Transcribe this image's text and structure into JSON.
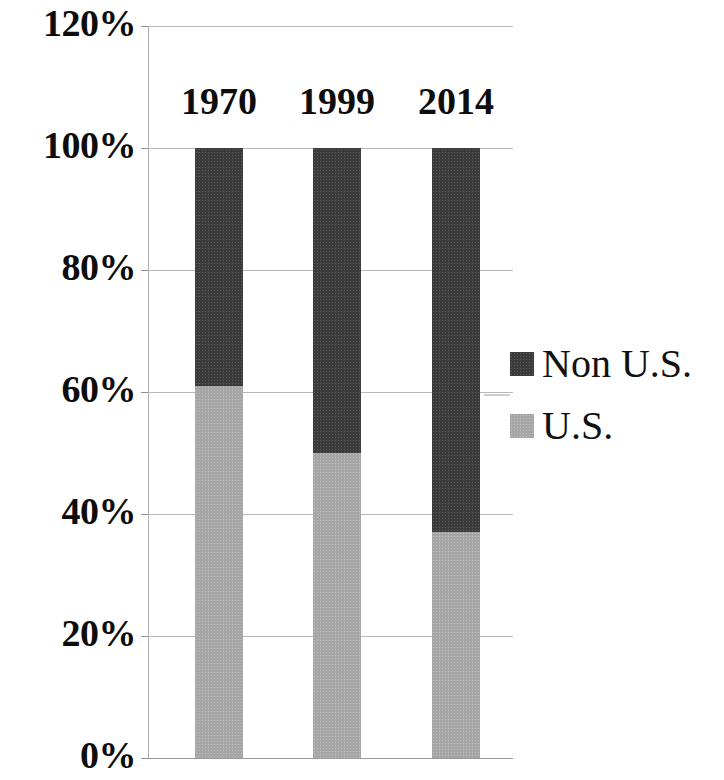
{
  "chart_data": {
    "type": "bar",
    "subtype": "stacked-100-percent",
    "title": "",
    "xlabel": "",
    "ylabel": "",
    "categories": [
      "1970",
      "1999",
      "2014"
    ],
    "series": [
      {
        "name": "U.S.",
        "values": [
          61,
          50,
          37
        ],
        "color": "#a6a6a6"
      },
      {
        "name": "Non U.S.",
        "values": [
          39,
          50,
          63
        ],
        "color": "#3b3b3b"
      }
    ],
    "ylim": [
      0,
      120
    ],
    "ytick_values": [
      0,
      20,
      40,
      60,
      80,
      100,
      120
    ],
    "ytick_labels": [
      "0%",
      "20%",
      "40%",
      "60%",
      "80%",
      "100%",
      "120%"
    ],
    "grid": true,
    "legend_position": "right",
    "legend_entries": [
      "Non U.S.",
      "U.S."
    ],
    "units": "percent",
    "stack_total": 100
  },
  "axis": {
    "ticks": [
      {
        "label": "120%",
        "value": 120
      },
      {
        "label": "100%",
        "value": 100
      },
      {
        "label": "80%",
        "value": 80
      },
      {
        "label": "60%",
        "value": 60
      },
      {
        "label": "40%",
        "value": 40
      },
      {
        "label": "20%",
        "value": 20
      },
      {
        "label": "0%",
        "value": 0
      }
    ]
  },
  "categories": [
    {
      "label": "1970",
      "us": 61,
      "non_us": 39
    },
    {
      "label": "1999",
      "us": 50,
      "non_us": 50
    },
    {
      "label": "2014",
      "us": 37,
      "non_us": 63
    }
  ],
  "legend": [
    {
      "label": "Non U.S.",
      "color": "#3b3b3b"
    },
    {
      "label": "U.S.",
      "color": "#a6a6a6"
    }
  ]
}
